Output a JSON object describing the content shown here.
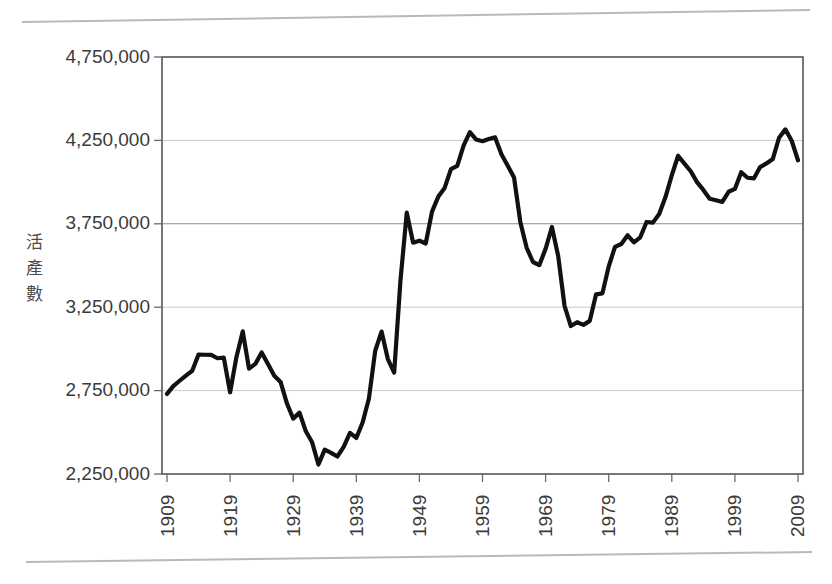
{
  "page": {
    "background_color": "#ffffff",
    "top_rule": "page-edge-line",
    "bottom_rule": "page-edge-line"
  },
  "chart_data": {
    "type": "line",
    "title": "",
    "subtitle": "",
    "xlabel": "",
    "ylabel": "活產數",
    "ylabel_chars": [
      "活",
      "產",
      "數"
    ],
    "grid": true,
    "grid_axis": "y",
    "legend": false,
    "legend_position": "none",
    "line_color": "#111111",
    "xlim": [
      1909,
      2009
    ],
    "ylim": [
      2250000,
      4750000
    ],
    "ytick_values": [
      2250000,
      2750000,
      3250000,
      3750000,
      4250000,
      4750000
    ],
    "ytick_labels": [
      "2,250,000",
      "2,750,000",
      "3,250,000",
      "3,750,000",
      "4,250,000",
      "4,750,000"
    ],
    "xtick_values": [
      1909,
      1919,
      1929,
      1939,
      1949,
      1959,
      1969,
      1979,
      1989,
      1999,
      2009
    ],
    "xtick_labels": [
      "1909",
      "1919",
      "1929",
      "1939",
      "1949",
      "1959",
      "1969",
      "1979",
      "1989",
      "1999",
      "2009"
    ],
    "xtick_rotation": 90,
    "x": [
      1909,
      1910,
      1911,
      1912,
      1913,
      1914,
      1915,
      1916,
      1917,
      1918,
      1919,
      1920,
      1921,
      1922,
      1923,
      1924,
      1925,
      1926,
      1927,
      1928,
      1929,
      1930,
      1931,
      1932,
      1933,
      1934,
      1935,
      1936,
      1937,
      1938,
      1939,
      1940,
      1941,
      1942,
      1943,
      1944,
      1945,
      1946,
      1947,
      1948,
      1949,
      1950,
      1951,
      1952,
      1953,
      1954,
      1955,
      1956,
      1957,
      1958,
      1959,
      1960,
      1961,
      1962,
      1963,
      1964,
      1965,
      1966,
      1967,
      1968,
      1969,
      1970,
      1971,
      1972,
      1973,
      1974,
      1975,
      1976,
      1977,
      1978,
      1979,
      1980,
      1981,
      1982,
      1983,
      1984,
      1985,
      1986,
      1987,
      1988,
      1989,
      1990,
      1991,
      1992,
      1993,
      1994,
      1995,
      1996,
      1997,
      1998,
      1999,
      2000,
      2001,
      2002,
      2003,
      2004,
      2005,
      2006,
      2007,
      2008,
      2009
    ],
    "y": [
      2730000,
      2777000,
      2809000,
      2840000,
      2869000,
      2966000,
      2965000,
      2964000,
      2944000,
      2948000,
      2740000,
      2950000,
      3105000,
      2882000,
      2910000,
      2979000,
      2909000,
      2839000,
      2802000,
      2674000,
      2582000,
      2618000,
      2506000,
      2440000,
      2307000,
      2396000,
      2377000,
      2355000,
      2413000,
      2496000,
      2466000,
      2559000,
      2703000,
      2989000,
      3104000,
      2939000,
      2858000,
      3411000,
      3817000,
      3637000,
      3649000,
      3632000,
      3823000,
      3913000,
      3965000,
      4078000,
      4097000,
      4218000,
      4300000,
      4255000,
      4245000,
      4258000,
      4268000,
      4167000,
      4098000,
      4027000,
      3760000,
      3606000,
      3521000,
      3502000,
      3600000,
      3731000,
      3556000,
      3258000,
      3137000,
      3160000,
      3144000,
      3168000,
      3327000,
      3333000,
      3494000,
      3612000,
      3629000,
      3681000,
      3639000,
      3669000,
      3761000,
      3757000,
      3809000,
      3910000,
      4041000,
      4158000,
      4111000,
      4065000,
      4000000,
      3953000,
      3900000,
      3891000,
      3881000,
      3942000,
      3959000,
      4059000,
      4026000,
      4022000,
      4090000,
      4112000,
      4138000,
      4266000,
      4316000,
      4248000,
      4131000
    ],
    "annotations": []
  }
}
